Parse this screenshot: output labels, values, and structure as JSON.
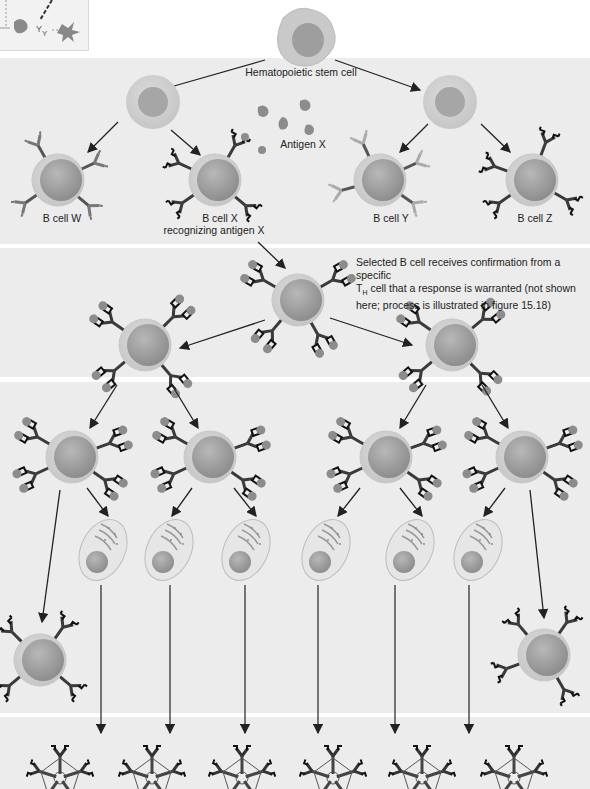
{
  "figure": {
    "thumbnail": {
      "description": "Inset overview icon: cell → fragments → star-shaped cell with dashed arrows"
    },
    "labels": {
      "stem_cell": "Hematopoietic stem cell",
      "antigen": "Antigen X",
      "b_cell_w": "B cell W",
      "b_cell_x_line1": "B cell X",
      "b_cell_x_line2": "recognizing antigen X",
      "b_cell_y": "B cell Y",
      "b_cell_z": "B cell Z"
    },
    "note": {
      "line1": "Selected B cell receives confirmation from a specific",
      "th_main": "T",
      "th_sub": "H",
      "line2_rest": " cell that a response is warranted (not shown",
      "line3": "here; process is illustrated in figure 15.18)"
    },
    "stages": [
      {
        "name": "Hematopoietic stem cell differentiation into B cells W, X, Y, Z",
        "band": 1
      },
      {
        "name": "Clonal selection of B cell X binding antigen X",
        "band": 2
      },
      {
        "name": "Clonal expansion into memory B cells and plasma cells",
        "band": 3
      },
      {
        "name": "Plasma cells secrete antibodies (pentameric)",
        "band": 4
      }
    ],
    "colors": {
      "band_bg": "#ececec",
      "cell_outer": "#c9c9c9",
      "cell_nucleus": "#9a9a9a",
      "antibody_dark": "#3a3a3a",
      "antigen": "#8c8c8c",
      "arrow": "#222222"
    }
  }
}
